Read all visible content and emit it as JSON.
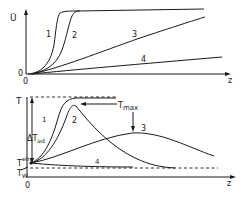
{
  "figure": {
    "top_plot": {
      "y_label": "Ū",
      "y_origin_label": "0",
      "x_origin_label": "0",
      "x_label": "z",
      "curve_labels": [
        "1",
        "2",
        "3",
        "4"
      ]
    },
    "bottom_plot": {
      "y_label": "T",
      "delta_label": "ΔT",
      "delta_sub": "ad",
      "t_ein_label": "T",
      "t_ein_sub": "ein",
      "t_w_label": "T",
      "t_w_sub": "W",
      "tmax_label": "T",
      "tmax_sub": "max",
      "x_origin_label": "0",
      "x_label": "z",
      "curve_labels": [
        "1",
        "2",
        "3",
        "4"
      ]
    },
    "ink_color": "#1a1a1a"
  }
}
